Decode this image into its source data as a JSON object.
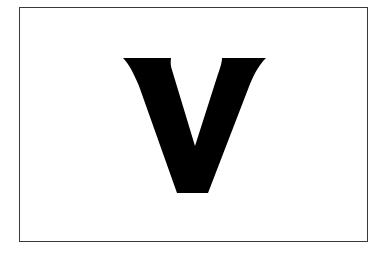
{
  "card": {
    "letter": "V",
    "border_color": "#3a3a3a",
    "background_color": "#ffffff",
    "glyph_color": "#000000",
    "glyph_path": "M123,58 L171,58 C171,60 170,64 172,70 L195,146 L218,74 C221,66 222,61 222,58 L266,58 C260,64 255,72 250,84 L208,193 L177,193 L139,86 C134,74 129,64 123,58 Z"
  }
}
